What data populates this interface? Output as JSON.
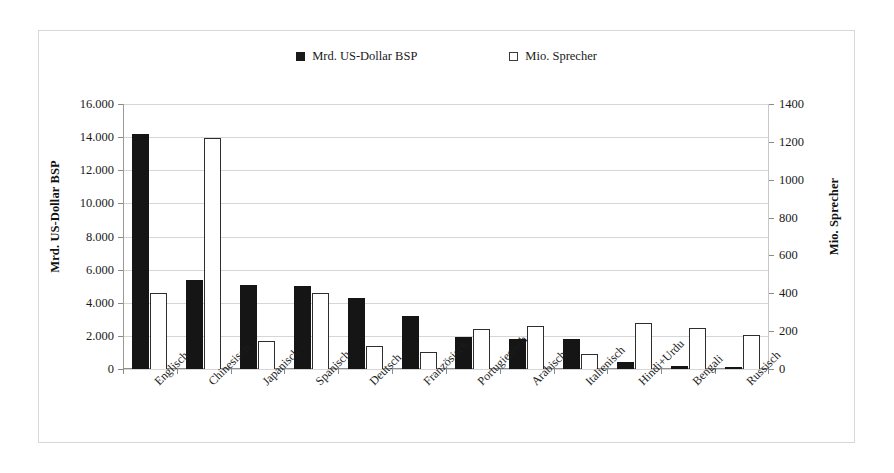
{
  "chart_data": {
    "type": "bar",
    "title": "",
    "subtitle": "",
    "xlabel": "",
    "categories": [
      "Englisch",
      "Chinesisch",
      "Japanisch",
      "Spanisch",
      "Deutsch",
      "Französisch",
      "Portugiesisch",
      "Arabisch",
      "Italienisch",
      "Hindi+Urdu",
      "Bengali",
      "Russisch"
    ],
    "series": [
      {
        "name": "Mrd. US-Dollar BSP",
        "axis": "left",
        "color": "#151515",
        "style": "filled",
        "values": [
          14200,
          5400,
          5100,
          5000,
          4300,
          3200,
          1950,
          1800,
          1800,
          400,
          200,
          150
        ]
      },
      {
        "name": "Mio. Sprecher",
        "axis": "right",
        "color": "#ffffff",
        "style": "hollow",
        "values": [
          400,
          1220,
          150,
          400,
          120,
          90,
          210,
          225,
          80,
          245,
          215,
          180
        ]
      }
    ],
    "left_axis": {
      "label": "Mrd. US-Dollar BSP",
      "ticks": [
        "0",
        "2.000",
        "4.000",
        "6.000",
        "8.000",
        "10.000",
        "12.000",
        "14.000",
        "16.000"
      ],
      "tick_values": [
        0,
        2000,
        4000,
        6000,
        8000,
        10000,
        12000,
        14000,
        16000
      ],
      "min": 0,
      "max": 16000
    },
    "right_axis": {
      "label": "Mio. Sprecher",
      "ticks": [
        "0",
        "200",
        "400",
        "600",
        "800",
        "1000",
        "1200",
        "1400"
      ],
      "tick_values": [
        0,
        200,
        400,
        600,
        800,
        1000,
        1200,
        1400
      ],
      "min": 0,
      "max": 1400
    },
    "grid": true,
    "legend_position": "top-center"
  },
  "legend": {
    "entries": [
      {
        "label": "Mrd. US-Dollar BSP",
        "swatch": "filled-square-icon"
      },
      {
        "label": "Mio. Sprecher",
        "swatch": "hollow-square-icon"
      }
    ]
  }
}
